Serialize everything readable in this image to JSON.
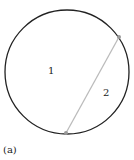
{
  "diagram": {
    "circle": {
      "cx": 67,
      "cy": 72,
      "r": 62,
      "stroke": "#222222"
    },
    "chord": {
      "x1": 119,
      "y1": 37,
      "x2": 66,
      "y2": 133,
      "stroke": "#bbbbbb"
    },
    "regions": [
      {
        "label": "1"
      },
      {
        "label": "2"
      }
    ],
    "caption": "(a)"
  }
}
